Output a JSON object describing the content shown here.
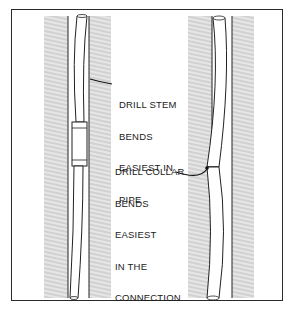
{
  "figure": {
    "labels": {
      "drill_stem": [
        "DRILL STEM",
        "BENDS",
        "EASIEST IN",
        "PIPE"
      ],
      "drill_collar": [
        "DRILL COLLAR",
        "BENDS",
        "EASIEST",
        "IN THE",
        "CONNECTION"
      ]
    },
    "colors": {
      "ink": "#1a1a1a",
      "hatch": "#6a6a6a",
      "background": "#ffffff"
    }
  }
}
